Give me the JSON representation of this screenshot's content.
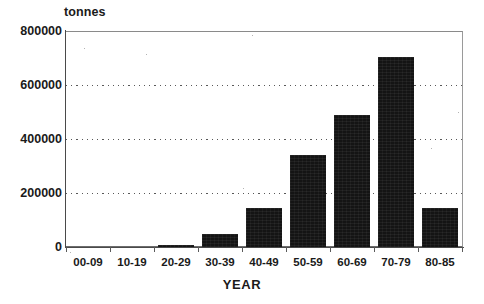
{
  "chart_data": {
    "type": "bar",
    "title": "",
    "subtitle": "",
    "unit_label": "tonnes",
    "xlabel": "YEAR",
    "ylabel": "",
    "categories": [
      "00-09",
      "10-19",
      "20-29",
      "30-39",
      "40-49",
      "50-59",
      "60-69",
      "70-79",
      "80-85"
    ],
    "values": [
      0,
      0,
      7000,
      48000,
      145000,
      340000,
      490000,
      705000,
      145000
    ],
    "ylim": [
      0,
      800000
    ],
    "ytick_labels": [
      "0",
      "200000",
      "400000",
      "600000",
      "800000"
    ],
    "ytick_values": [
      0,
      200000,
      400000,
      600000,
      800000
    ],
    "gridlines": {
      "visible": true,
      "style": "dotted",
      "at": [
        200000,
        400000,
        600000
      ]
    },
    "legend": {
      "visible": false,
      "entries": []
    },
    "bar_color": "#141414",
    "axis_color": "#4a4a4a",
    "background": "#ffffff"
  },
  "labels": {
    "unit": "tonnes",
    "x_axis_title": "YEAR"
  }
}
